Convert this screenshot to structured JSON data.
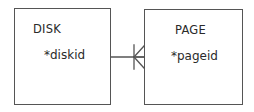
{
  "diagram": {
    "type": "entity-relationship",
    "entities": [
      {
        "name": "DISK",
        "attributes": [
          "*diskid"
        ]
      },
      {
        "name": "PAGE",
        "attributes": [
          "*pageid"
        ]
      }
    ],
    "relationships": [
      {
        "from": "DISK",
        "to": "PAGE",
        "from_cardinality": "one",
        "to_cardinality": "many",
        "notation": "crow's foot"
      }
    ],
    "colors": {
      "stroke": "#555555",
      "text": "#2a2a2a",
      "background": "#ffffff"
    }
  }
}
